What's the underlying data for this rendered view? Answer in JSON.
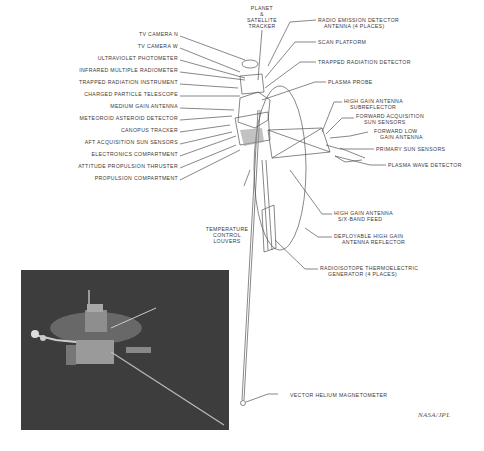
{
  "diagram": {
    "left_labels": [
      {
        "text": "TV CAMERA N",
        "x": 178,
        "y": 34
      },
      {
        "text": "TV CAMERA W",
        "x": 178,
        "y": 46
      },
      {
        "text": "ULTRAVIOLET PHOTOMETER",
        "x": 178,
        "y": 58
      },
      {
        "text": "INFRARED MULTIPLE RADIOMETER",
        "x": 178,
        "y": 70
      },
      {
        "text": "TRAPPED RADIATION INSTRUMENT",
        "x": 178,
        "y": 82
      },
      {
        "text": "CHARGED PARTICLE TELESCOPE",
        "x": 178,
        "y": 94
      },
      {
        "text": "MEDIUM GAIN ANTENNA",
        "x": 178,
        "y": 106
      },
      {
        "text": "METEOROID ASTEROID DETECTOR",
        "x": 178,
        "y": 118
      },
      {
        "text": "CANOPUS TRACKER",
        "x": 178,
        "y": 130
      },
      {
        "text": "AFT ACQUISITION SUN SENSORS",
        "x": 178,
        "y": 142
      },
      {
        "text": "ELECTRONICS COMPARTMENT",
        "x": 178,
        "y": 154
      },
      {
        "text": "ATTITUDE PROPULSION THRUSTER",
        "x": 178,
        "y": 166
      },
      {
        "text": "PROPULSION COMPARTMENT",
        "x": 178,
        "y": 178
      }
    ],
    "right_labels": [
      {
        "lines": [
          "RADIO EMISSION DETECTOR",
          "ANTENNA (4 PLACES)"
        ],
        "x": 318,
        "y": 17
      },
      {
        "lines": [
          "SCAN PLATFORM"
        ],
        "x": 318,
        "y": 40
      },
      {
        "lines": [
          "TRAPPED RADIATION DETECTOR"
        ],
        "x": 318,
        "y": 60
      },
      {
        "lines": [
          "PLASMA PROBE"
        ],
        "x": 328,
        "y": 80
      },
      {
        "lines": [
          "HIGH GAIN ANTENNA",
          "SUBREFLECTOR"
        ],
        "x": 344,
        "y": 100
      },
      {
        "lines": [
          "FORWARD ACQUISITION",
          "SUN SENSORS"
        ],
        "x": 356,
        "y": 116
      },
      {
        "lines": [
          "FORWARD LOW",
          "GAIN ANTENNA"
        ],
        "x": 370,
        "y": 130
      },
      {
        "lines": [
          "PRIMARY SUN SENSORS"
        ],
        "x": 376,
        "y": 147
      },
      {
        "lines": [
          "PLASMA WAVE DETECTOR"
        ],
        "x": 388,
        "y": 163
      },
      {
        "lines": [
          "HIGH GAIN ANTENNA",
          "S/X-BAND FEED"
        ],
        "x": 334,
        "y": 212
      },
      {
        "lines": [
          "DEPLOYABLE HIGH GAIN",
          "ANTENNA REFLECTOR"
        ],
        "x": 334,
        "y": 235
      },
      {
        "lines": [
          "RADIOISOTOPE THERMOELECTRIC",
          "GENERATOR (4 PLACES)"
        ],
        "x": 320,
        "y": 267
      }
    ],
    "top_label": {
      "lines": [
        "PLANET",
        "&",
        "SATELLITE",
        "TRACKER"
      ]
    },
    "center_label": {
      "lines": [
        "TEMPERATURE",
        "CONTROL",
        "LOUVERS"
      ]
    },
    "bottom_label": "VECTOR HELIUM MAGNETOMETER",
    "credit": "NASA/JPL"
  },
  "photo": {
    "description": "Rendered photo of spacecraft on dark background"
  }
}
